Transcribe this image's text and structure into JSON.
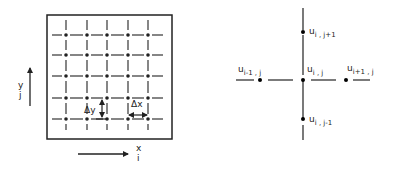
{
  "figure": {
    "left_panel": {
      "name": "computational-grid",
      "grid_columns": 5,
      "grid_rows": 5,
      "y_axis": {
        "label": "y",
        "index_label": "j"
      },
      "x_axis": {
        "label": "x",
        "index_label": "i"
      },
      "delta_y_label": "Δy",
      "delta_x_label": "Δx"
    },
    "right_panel": {
      "name": "five-point-stencil",
      "nodes": [
        {
          "id": "center",
          "base": "u",
          "sub": "i , j"
        },
        {
          "id": "left",
          "base": "u",
          "sub": "i-1 , j"
        },
        {
          "id": "right",
          "base": "u",
          "sub": "i+1 , j"
        },
        {
          "id": "top",
          "base": "u",
          "sub": "i , j+1"
        },
        {
          "id": "bottom",
          "base": "u",
          "sub": "i , j-1"
        }
      ]
    },
    "colors": {
      "ink": "#222222",
      "background": "#ffffff"
    }
  }
}
